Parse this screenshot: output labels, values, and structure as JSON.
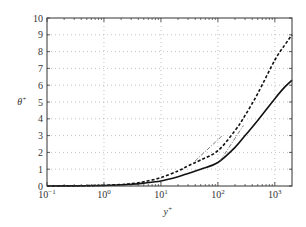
{
  "chart_data": {
    "type": "line",
    "title": "",
    "xlabel": "y+",
    "ylabel": "θ+",
    "xscale": "log",
    "xlim": [
      0.1,
      2000
    ],
    "ylim": [
      0,
      10
    ],
    "grid": true,
    "legend": null,
    "x_ticks": [
      {
        "base": "10",
        "exp": "-1",
        "value": 0.1
      },
      {
        "base": "10",
        "exp": "0",
        "value": 1
      },
      {
        "base": "10",
        "exp": "1",
        "value": 10
      },
      {
        "base": "10",
        "exp": "2",
        "value": 100
      },
      {
        "base": "10",
        "exp": "3",
        "value": 1000
      }
    ],
    "y_ticks": [
      "0",
      "1",
      "2",
      "3",
      "4",
      "5",
      "6",
      "7",
      "8",
      "9",
      "10"
    ],
    "series": [
      {
        "name": "dashed",
        "style": "dashed",
        "width": 1.6,
        "x": [
          0.1,
          0.3,
          1,
          2,
          3,
          5,
          10,
          20,
          30,
          50,
          100,
          200,
          300,
          500,
          1000,
          1500,
          2000
        ],
        "y": [
          0.0,
          0.01,
          0.04,
          0.09,
          0.14,
          0.25,
          0.5,
          0.9,
          1.2,
          1.55,
          2.1,
          3.3,
          4.2,
          5.5,
          7.5,
          8.4,
          9.0
        ]
      },
      {
        "name": "solid",
        "style": "solid",
        "width": 1.6,
        "x": [
          0.1,
          0.3,
          1,
          2,
          3,
          5,
          10,
          20,
          30,
          50,
          100,
          200,
          300,
          500,
          1000,
          1500,
          2000
        ],
        "y": [
          0.0,
          0.01,
          0.03,
          0.07,
          0.1,
          0.17,
          0.3,
          0.55,
          0.75,
          1.0,
          1.4,
          2.3,
          3.0,
          3.9,
          5.2,
          5.9,
          6.3
        ]
      },
      {
        "name": "reference-1",
        "style": "dashdot-thin",
        "width": 0.7,
        "x": [
          40,
          120
        ],
        "y": [
          1.5,
          3.0
        ]
      },
      {
        "name": "reference-2",
        "style": "dashdot-thin",
        "width": 0.7,
        "x": [
          110,
          280
        ],
        "y": [
          1.5,
          3.6
        ]
      }
    ]
  }
}
